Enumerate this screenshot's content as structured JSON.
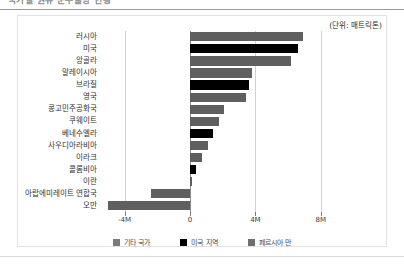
{
  "header": {
    "title_partial": "국가별 원유 순수출량 현황",
    "unit_label": "(단위: 매트릭톤)"
  },
  "legend": {
    "items": [
      {
        "label": "기타 국가",
        "color": "#7a7a7a",
        "key": "other"
      },
      {
        "label": "미국 지역",
        "color": "#000000",
        "key": "us"
      },
      {
        "label": "페르시아 만",
        "color": "#6e6e6e",
        "key": "gulf"
      }
    ]
  },
  "chart_data": {
    "type": "bar",
    "orientation": "horizontal",
    "title": "국가별 원유 순수출량 현황",
    "xlabel": "",
    "ylabel": "",
    "unit": "매트릭톤",
    "xlim": [
      -5.5,
      8.5
    ],
    "xticks": [
      -4,
      0,
      4,
      8
    ],
    "xticklabels": [
      "-4M",
      "0",
      "4M",
      "8M"
    ],
    "grid": false,
    "legend_position": "bottom",
    "categories": [
      "러시아",
      "미국",
      "앙골라",
      "말레이시아",
      "브라질",
      "영국",
      "콩고민주공화국",
      "쿠웨이트",
      "베네수엘라",
      "사우디아라비아",
      "이라크",
      "콜롬비아",
      "이란",
      "아랍에미레이트 연합국",
      "오만"
    ],
    "values": [
      6.9,
      6.6,
      6.2,
      3.8,
      3.6,
      3.4,
      2.1,
      1.8,
      1.4,
      1.1,
      0.75,
      0.4,
      0.15,
      -2.4,
      -5.0
    ],
    "group": [
      "other",
      "us",
      "other",
      "other",
      "us",
      "other",
      "other",
      "gulf",
      "us",
      "gulf",
      "gulf",
      "us",
      "gulf",
      "gulf",
      "gulf"
    ]
  }
}
